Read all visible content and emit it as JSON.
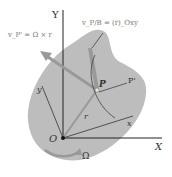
{
  "labels": {
    "y_axis": "Y",
    "x_axis": "X",
    "origin": "O",
    "point_p": "P",
    "point_p_prime": "P'",
    "r_vector": "r",
    "x_body": "x",
    "y_body": "y",
    "omega": "Ω",
    "v_rel": "v_P/B = (ṙ)_Oxy",
    "v_transport": "v_P' = Ω × r"
  },
  "colors": {
    "body_fill": "#bdbdbd",
    "arrow": "#9a9a9a",
    "line": "#222222",
    "text": "#333333"
  }
}
